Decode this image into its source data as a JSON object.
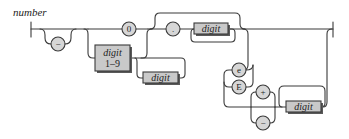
{
  "diagram": {
    "title": "number",
    "type": "railroad-syntax-diagram",
    "nodes": {
      "minus": "−",
      "zero": "0",
      "digit19_line1": "digit",
      "digit19_line2": "1–9",
      "digit_int_repeat": "digit",
      "dot": ".",
      "digit_frac": "digit",
      "e_lower": "e",
      "e_upper": "E",
      "plus": "+",
      "exp_minus": "−",
      "digit_exp": "digit"
    },
    "colors": {
      "line": "#3a3a3a",
      "terminal_fill": "#d6d6d6",
      "nonterminal_fill": "#c9c9c9",
      "background": "#ffffff"
    }
  }
}
